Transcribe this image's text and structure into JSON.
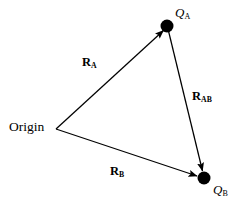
{
  "figure": {
    "background_color": "#ffffff",
    "stroke_color": "#000000",
    "width": 242,
    "height": 209
  },
  "labels": {
    "origin": "Origin",
    "point_a": "Q",
    "point_a_sub": "A",
    "point_b": "Q",
    "point_b_sub": "B",
    "vector_a": "R",
    "vector_a_sub": "A",
    "vector_ab": "R",
    "vector_ab_sub": "AB",
    "vector_b": "R",
    "vector_b_sub": "B"
  },
  "geometry": {
    "origin_point": {
      "x": 56,
      "y": 129
    },
    "point_a": {
      "x": 167,
      "y": 26,
      "radius": 6.5
    },
    "point_b": {
      "x": 204,
      "y": 178,
      "radius": 6.5
    },
    "vectors": [
      {
        "name": "R_A",
        "from": "origin",
        "to": "point_a"
      },
      {
        "name": "R_AB",
        "from": "point_a",
        "to": "point_b"
      },
      {
        "name": "R_B",
        "from": "origin",
        "to": "point_b"
      }
    ]
  }
}
